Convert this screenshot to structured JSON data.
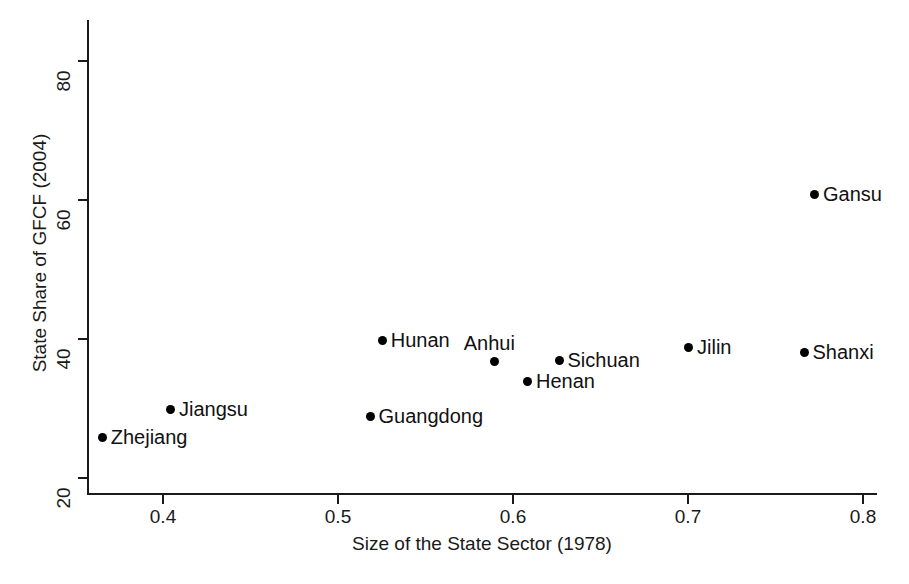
{
  "chart_data": {
    "type": "scatter",
    "title": "",
    "xlabel": "Size of the State Sector (1978)",
    "ylabel": "State Share of GFCF (2004)",
    "xlim": [
      0.355,
      0.81
    ],
    "ylim": [
      18.5,
      84
    ],
    "xticks": [
      0.4,
      0.5,
      0.6,
      0.7,
      0.8
    ],
    "xticklabels": [
      "0.4",
      "0.5",
      "0.6",
      "0.7",
      "0.8"
    ],
    "yticks": [
      20,
      40,
      60,
      80
    ],
    "yticklabels": [
      "20",
      "40",
      "60",
      "80"
    ],
    "grid": false,
    "legend": null,
    "points": [
      {
        "label": "Zhejiang",
        "x": 0.365,
        "y": 25.9,
        "label_pos": "right"
      },
      {
        "label": "Jiangsu",
        "x": 0.404,
        "y": 29.9,
        "label_pos": "right"
      },
      {
        "label": "Guangdong",
        "x": 0.518,
        "y": 28.9,
        "label_pos": "right"
      },
      {
        "label": "Hunan",
        "x": 0.525,
        "y": 39.9,
        "label_pos": "right"
      },
      {
        "label": "Anhui",
        "x": 0.589,
        "y": 36.9,
        "label_pos": "above"
      },
      {
        "label": "Henan",
        "x": 0.608,
        "y": 34.0,
        "label_pos": "right"
      },
      {
        "label": "Sichuan",
        "x": 0.626,
        "y": 37.0,
        "label_pos": "right"
      },
      {
        "label": "Jilin",
        "x": 0.7,
        "y": 38.9,
        "label_pos": "right"
      },
      {
        "label": "Shanxi",
        "x": 0.766,
        "y": 38.1,
        "label_pos": "right"
      },
      {
        "label": "Gansu",
        "x": 0.772,
        "y": 60.9,
        "label_pos": "right"
      }
    ],
    "marker": {
      "shape": "circle",
      "color": "#000000",
      "size": 9
    }
  },
  "figure": {
    "caption": ""
  }
}
